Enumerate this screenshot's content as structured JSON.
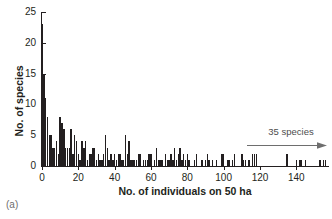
{
  "panel_label": "(a)",
  "annotation": {
    "text": "35 species",
    "icon": "right-arrow-icon"
  },
  "chart_data": {
    "type": "bar",
    "title": "",
    "subtitle": "",
    "xlabel": "No. of individuals on 50 ha",
    "ylabel": "No. of species",
    "xlim": [
      0,
      158
    ],
    "ylim": [
      0,
      25
    ],
    "xticks": [
      0,
      20,
      40,
      60,
      80,
      100,
      120,
      140
    ],
    "yticks": [
      0,
      5,
      10,
      15,
      20,
      25
    ],
    "xtick_labels": [
      "0",
      "20",
      "40",
      "60",
      "80",
      "100",
      "120",
      "140"
    ],
    "ytick_labels": [
      "0",
      "5",
      "10",
      "15",
      "20",
      "25"
    ],
    "grid": false,
    "legend": null,
    "bar_color": "#231f20",
    "bar_width": 1,
    "annotations": [
      {
        "text": "35 species",
        "x_start": 130,
        "x_end": 158,
        "y": 4,
        "arrow": "right"
      }
    ],
    "x": [
      0,
      1,
      2,
      3,
      4,
      5,
      6,
      7,
      8,
      9,
      10,
      11,
      12,
      13,
      14,
      15,
      16,
      17,
      18,
      19,
      20,
      21,
      22,
      23,
      24,
      25,
      26,
      27,
      28,
      29,
      30,
      31,
      32,
      33,
      34,
      35,
      36,
      37,
      38,
      39,
      40,
      41,
      42,
      43,
      44,
      45,
      46,
      47,
      48,
      49,
      50,
      51,
      52,
      53,
      54,
      55,
      56,
      57,
      58,
      59,
      60,
      61,
      62,
      63,
      64,
      65,
      66,
      67,
      68,
      69,
      70,
      71,
      72,
      73,
      74,
      75,
      76,
      77,
      78,
      79,
      80,
      81,
      82,
      83,
      84,
      85,
      86,
      87,
      88,
      89,
      90,
      91,
      92,
      93,
      94,
      95,
      96,
      97,
      98,
      99,
      100,
      101,
      102,
      103,
      104,
      105,
      106,
      107,
      108,
      109,
      110,
      111,
      112,
      113,
      114,
      115,
      116,
      117,
      118,
      119,
      120,
      121,
      122,
      123,
      124,
      125,
      126,
      127,
      128,
      129,
      130,
      131,
      132,
      133,
      134,
      135,
      136,
      137,
      138,
      139,
      140,
      141,
      142,
      143,
      144,
      145,
      146,
      147,
      148,
      149,
      150,
      151,
      152,
      153,
      154,
      155,
      156,
      157
    ],
    "values": [
      23,
      15,
      11,
      8,
      5,
      5,
      3,
      3,
      4,
      2,
      8,
      7,
      6,
      3,
      3,
      3,
      6,
      2,
      5,
      4,
      2,
      1,
      4,
      3,
      4,
      1,
      2,
      2,
      3,
      3,
      1,
      2,
      1,
      1,
      2,
      5,
      3,
      1,
      2,
      1,
      2,
      1,
      2,
      2,
      1,
      1,
      5,
      2,
      4,
      1,
      1,
      1,
      1,
      2,
      2,
      0,
      1,
      1,
      1,
      2,
      2,
      0,
      1,
      3,
      1,
      1,
      1,
      0,
      2,
      1,
      1,
      2,
      1,
      3,
      1,
      2,
      3,
      1,
      2,
      1,
      2,
      1,
      0,
      0,
      1,
      2,
      0,
      0,
      1,
      0,
      1,
      2,
      1,
      0,
      1,
      0,
      1,
      0,
      0,
      2,
      2,
      0,
      1,
      1,
      0,
      1,
      2,
      0,
      0,
      0,
      2,
      1,
      1,
      0,
      1,
      0,
      2,
      2,
      2,
      0,
      0,
      0,
      0,
      0,
      0,
      0,
      0,
      0,
      0,
      0,
      0,
      0,
      0,
      0,
      0,
      2,
      0,
      0,
      0,
      0,
      1,
      0,
      1,
      1,
      0,
      1,
      0,
      0,
      0,
      0,
      0,
      0,
      0,
      1,
      0,
      1,
      1,
      0
    ]
  }
}
